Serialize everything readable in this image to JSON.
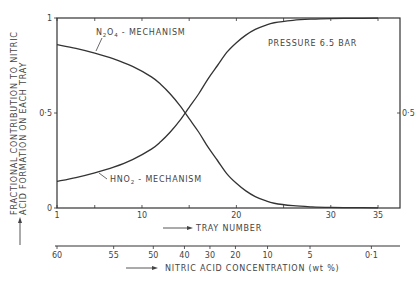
{
  "chart_data": {
    "type": "line",
    "title": "",
    "xlabel": "TRAY NUMBER",
    "ylabel_line1": "FRACTIONAL CONTRIBUTION TO NITRIC",
    "ylabel_line2": "ACID FORMATION ON EACH TRAY",
    "secondary_xlabel": "NITRIC ACID CONCENTRATION (wt %)",
    "annotation": "PRESSURE 6.5 BAR",
    "xlim": [
      1,
      37
    ],
    "ylim": [
      0,
      1
    ],
    "x_ticks": [
      {
        "value": 1,
        "label": "1"
      },
      {
        "value": 5,
        "label": ""
      },
      {
        "value": 10,
        "label": "10"
      },
      {
        "value": 15,
        "label": ""
      },
      {
        "value": 20,
        "label": "20"
      },
      {
        "value": 25,
        "label": ""
      },
      {
        "value": 30,
        "label": "30"
      },
      {
        "value": 35,
        "label": "35"
      }
    ],
    "y_ticks_left": [
      {
        "value": 0,
        "label": "0"
      },
      {
        "value": 0.5,
        "label": "0·5"
      },
      {
        "value": 1,
        "label": "1"
      }
    ],
    "y_ticks_right": [
      {
        "value": 0.5,
        "label": "0·5"
      }
    ],
    "secondary_axis_ticks": [
      {
        "tray": 1,
        "label": "60"
      },
      {
        "tray": 7,
        "label": "55"
      },
      {
        "tray": 11.2,
        "label": "50"
      },
      {
        "tray": 14.5,
        "label": "40"
      },
      {
        "tray": 17.2,
        "label": "30"
      },
      {
        "tray": 19.9,
        "label": "20"
      },
      {
        "tray": 23.3,
        "label": "10"
      },
      {
        "tray": 27.8,
        "label": "5"
      },
      {
        "tray": 34.3,
        "label": "0·1"
      }
    ],
    "series": [
      {
        "name": "N2O4 - MECHANISM",
        "label_main": "N",
        "label_sub1": "2",
        "label_mid": "O",
        "label_sub2": "4",
        "label_rest": " - MECHANISM",
        "x": [
          1,
          3,
          5,
          7,
          9,
          11,
          12,
          13,
          14,
          15,
          16,
          17,
          18,
          19,
          20,
          21,
          22,
          23,
          24,
          26,
          28,
          30,
          32,
          35
        ],
        "values": [
          0.86,
          0.84,
          0.815,
          0.785,
          0.745,
          0.69,
          0.65,
          0.6,
          0.54,
          0.47,
          0.4,
          0.32,
          0.25,
          0.18,
          0.13,
          0.09,
          0.06,
          0.04,
          0.025,
          0.012,
          0.006,
          0.003,
          0.002,
          0.001
        ]
      },
      {
        "name": "HNO2 - MECHANISM",
        "label_main": "HNO",
        "label_sub1": "2",
        "label_rest": " - MECHANISM",
        "x": [
          1,
          3,
          5,
          7,
          9,
          11,
          12,
          13,
          14,
          15,
          16,
          17,
          18,
          19,
          20,
          21,
          22,
          23,
          24,
          26,
          28,
          30,
          32,
          35
        ],
        "values": [
          0.14,
          0.16,
          0.185,
          0.215,
          0.255,
          0.31,
          0.35,
          0.4,
          0.46,
          0.53,
          0.6,
          0.68,
          0.75,
          0.82,
          0.87,
          0.91,
          0.94,
          0.96,
          0.975,
          0.988,
          0.994,
          0.997,
          0.998,
          0.999
        ]
      }
    ]
  }
}
